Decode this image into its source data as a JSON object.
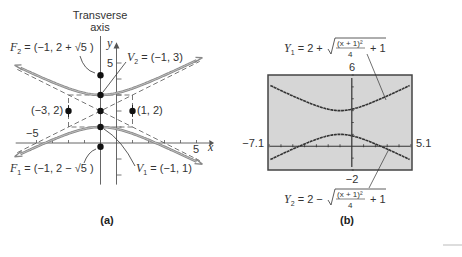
{
  "panel_a": {
    "caption": "(a)",
    "transverse_axis_label_line1": "Transverse",
    "transverse_axis_label_line2": "axis",
    "x_axis_label": "x",
    "y_axis_label": "y",
    "tick_labels": {
      "x_neg": "−5",
      "x_pos": "5",
      "y_pos": "5"
    },
    "points": {
      "F2": {
        "label_name": "F",
        "label_sub": "2",
        "label_value": " = (−1, 2 + √5 )",
        "x": -1,
        "y": 4.236
      },
      "V2": {
        "label_name": "V",
        "label_sub": "2",
        "label_value": " = (−1, 3)",
        "x": -1,
        "y": 3
      },
      "center": {
        "x": -1,
        "y": 2
      },
      "left": {
        "label": "(−3, 2)",
        "x": -3,
        "y": 2
      },
      "right": {
        "label": "(1, 2)",
        "x": 1,
        "y": 2
      },
      "V1": {
        "label_name": "V",
        "label_sub": "1",
        "label_value": " = (−1, 1)",
        "x": -1,
        "y": 1
      },
      "F1": {
        "label_name": "F",
        "label_sub": "1",
        "label_value": " = (−1, 2 − √5 )",
        "x": -1,
        "y": -0.236
      }
    },
    "hyperbola": {
      "h": -1,
      "k": 2,
      "a": 1,
      "b": 2,
      "x_range": [
        -6,
        5
      ]
    },
    "colors": {
      "curve": "#888888",
      "axis": "#555555",
      "dashed": "#555555",
      "dot": "#111111"
    }
  },
  "panel_b": {
    "caption": "(b)",
    "y1_label": {
      "name": "Y",
      "sub": "1",
      "prefix": " = 2 + ",
      "numerator": "(x + 1)²",
      "denominator": "4",
      "suffix": "+ 1"
    },
    "y2_label": {
      "name": "Y",
      "sub": "2",
      "prefix": " = 2 − ",
      "numerator": "(x + 1)²",
      "denominator": "4",
      "suffix": "+ 1"
    },
    "window": {
      "xmin": -7.1,
      "xmax": 5.1,
      "ymin": -2,
      "ymax": 6
    },
    "window_labels": {
      "xmin": "−7.1",
      "xmax": "5.1",
      "ymin": "−2",
      "ymax": "6"
    },
    "colors": {
      "screen_bg": "#d6d6d6",
      "screen_border": "#444444",
      "plot": "#333333"
    }
  }
}
